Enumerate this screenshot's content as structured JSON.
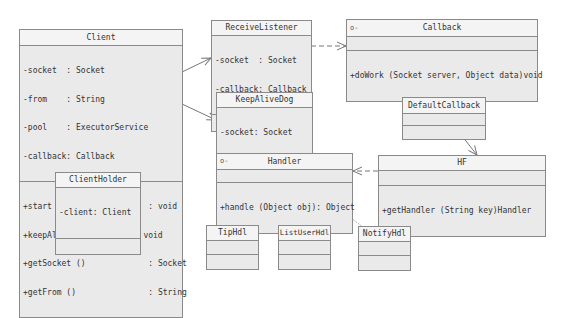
{
  "diagram": {
    "type": "UML class diagram",
    "classes": {
      "client": {
        "name": "Client",
        "attributes": [
          {
            "vis": "-",
            "name": "socket  ",
            "type": ": Socket"
          },
          {
            "vis": "-",
            "name": "from    ",
            "type": ": String"
          },
          {
            "vis": "-",
            "name": "pool    ",
            "type": ": ExecutorService"
          },
          {
            "vis": "-",
            "name": "callback",
            "type": ": Callback"
          }
        ],
        "operations": [
          {
            "vis": "+",
            "sig": "start ()                 ",
            "ret": ": void"
          },
          {
            "vis": "+",
            "sig": "keepAlive (String from) ",
            "ret": "void"
          },
          {
            "vis": "+",
            "sig": "getSocket ()             ",
            "ret": ": Socket"
          },
          {
            "vis": "+",
            "sig": "getFrom ()               ",
            "ret": ": String"
          }
        ]
      },
      "receive_listener": {
        "name": "ReceiveListener",
        "attributes": [
          {
            "vis": "-",
            "name": "socket  ",
            "type": ": Socket"
          },
          {
            "vis": "-",
            "name": "callback",
            "type": ": Callback"
          }
        ]
      },
      "callback": {
        "name": "Callback",
        "stereotype_mark": "o-",
        "operations": [
          {
            "vis": "+",
            "sig": "doWork (Socket server, Object data)",
            "ret": "void"
          }
        ]
      },
      "keep_alive_dog": {
        "name": "KeepAliveDog",
        "attributes": [
          {
            "vis": "-",
            "name": "socket",
            "type": ": Socket"
          },
          {
            "vis": "-",
            "name": "from  ",
            "type": ": String"
          }
        ]
      },
      "default_callback": {
        "name": "DefaultCallback"
      },
      "hf": {
        "name": "HF",
        "operations": [
          {
            "vis": "+",
            "sig": "getHandler (String key)",
            "ret": "Handler"
          }
        ]
      },
      "handler": {
        "name": "Handler",
        "stereotype_mark": "o-",
        "operations": [
          {
            "vis": "+",
            "sig": "handle (Object obj)",
            "ret": ": Object"
          }
        ]
      },
      "client_holder": {
        "name": "ClientHolder",
        "attributes": [
          {
            "vis": "-",
            "name": "client",
            "type": ": Client"
          }
        ]
      },
      "tip_hdl": {
        "name": "TipHdl"
      },
      "list_user_hdl": {
        "name": "ListUserHdl"
      },
      "notify_hdl": {
        "name": "NotifyHdl"
      }
    },
    "relationships": [
      {
        "from": "Client",
        "to": "ReceiveListener",
        "kind": "association"
      },
      {
        "from": "Client",
        "to": "KeepAliveDog",
        "kind": "association"
      },
      {
        "from": "ReceiveListener",
        "to": "Callback",
        "kind": "dependency"
      },
      {
        "from": "DefaultCallback",
        "to": "Callback",
        "kind": "realization"
      },
      {
        "from": "DefaultCallback",
        "to": "HF",
        "kind": "association"
      },
      {
        "from": "HF",
        "to": "Handler",
        "kind": "dependency"
      },
      {
        "from": "TipHdl",
        "to": "Handler",
        "kind": "realization"
      },
      {
        "from": "ListUserHdl",
        "to": "Handler",
        "kind": "realization"
      },
      {
        "from": "NotifyHdl",
        "to": "Handler",
        "kind": "realization"
      }
    ],
    "colors": {
      "box_fill": "#ececec",
      "header_fill": "#f4f4f4",
      "border": "#8a8a8a",
      "line": "#777777"
    }
  }
}
